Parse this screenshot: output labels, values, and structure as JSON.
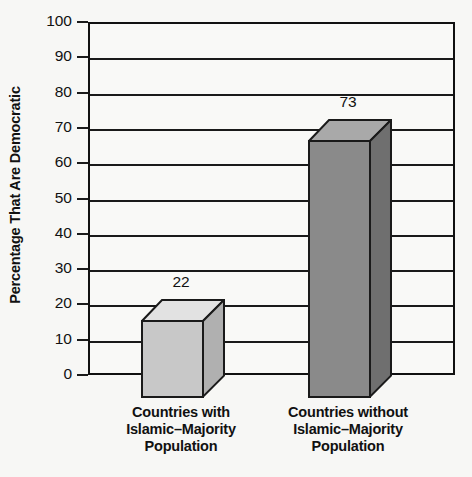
{
  "chart_data": {
    "type": "bar",
    "title": "",
    "subtitle": "",
    "xlabel": "",
    "ylabel": "Percentage That Are Democratic",
    "ylim": [
      0,
      100
    ],
    "ytick_step": 10,
    "yticks": [
      "100",
      "90",
      "80",
      "70",
      "60",
      "50",
      "40",
      "30",
      "20",
      "10",
      "0"
    ],
    "grid": "horizontal",
    "legend": "none",
    "categories": [
      "Countries with Islamic–Majority Population",
      "Countries without Islamic–Majority Population"
    ],
    "category_lines": [
      [
        "Countries with",
        "Islamic–Majority",
        "Population"
      ],
      [
        "Countries without",
        "Islamic–Majority",
        "Population"
      ]
    ],
    "values": [
      22,
      73
    ],
    "value_labels": [
      "22",
      "73"
    ],
    "bar_colors": [
      "#c8c8c8",
      "#8a8a8a"
    ],
    "bar_top_colors": [
      "#e2e2e2",
      "#a9a9a9"
    ],
    "bar_side_colors": [
      "#b0b0b0",
      "#6f6f6f"
    ],
    "outline_color": "#1a1a1a",
    "background_color": "#f7f7f5"
  }
}
